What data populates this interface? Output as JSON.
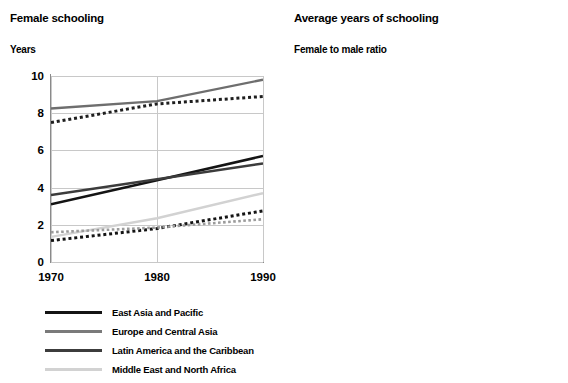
{
  "chart_data": [
    {
      "id": "female-schooling",
      "type": "line",
      "title": "Female schooling",
      "subtitle": "Years",
      "ylabel": "Years",
      "xlabel": "",
      "x": [
        1970,
        1980,
        1990
      ],
      "xticks": [
        "1970",
        "1980",
        "1990"
      ],
      "yticks": [
        "0",
        "2",
        "4",
        "6",
        "8",
        "10"
      ],
      "ylim": [
        0,
        10
      ],
      "xlim": [
        1970,
        1990
      ],
      "grid": true,
      "legend_position": "below",
      "series": [
        {
          "name": "East Asia and Pacific",
          "style": "solid",
          "color": "#141414",
          "width": 2.6,
          "values": [
            3.1,
            4.4,
            5.7
          ]
        },
        {
          "name": "Europe and Central Asia",
          "style": "solid",
          "color": "#6e6e6e",
          "width": 2.4,
          "values": [
            8.25,
            8.65,
            9.8
          ]
        },
        {
          "name": "Latin America and the Caribbean",
          "style": "solid",
          "color": "#3c3c3c",
          "width": 2.4,
          "values": [
            3.6,
            4.45,
            5.3
          ]
        },
        {
          "name": "Middle East and North Africa",
          "style": "solid",
          "color": "#d2d2d2",
          "width": 2.4,
          "values": [
            1.35,
            2.35,
            3.7
          ]
        },
        {
          "name": "South Asia",
          "style": "dotted",
          "color": "#141414",
          "width": 3.0,
          "values": [
            1.15,
            1.8,
            2.75
          ]
        },
        {
          "name": "Sub-Saharan Africa",
          "style": "dotted",
          "color": "#9b9b9b",
          "width": 2.6,
          "values": [
            1.6,
            1.85,
            2.3
          ]
        },
        {
          "name": "OECD",
          "style": "dotted",
          "color": "#1e1e1e",
          "width": 3.0,
          "values": [
            7.5,
            8.5,
            8.9
          ]
        }
      ]
    },
    {
      "id": "female-to-male-ratio",
      "type": "line",
      "title": "Average years of schooling",
      "subtitle": "Female to male ratio",
      "ylabel": "Female to male ratio",
      "xlabel": "",
      "x": [
        1970,
        1980,
        1990
      ],
      "xticks": [
        "1970",
        "1980",
        "1990"
      ],
      "yticks": [
        "0.2",
        "0.4",
        "0.6",
        "0.8",
        "1.0"
      ],
      "ylim": [
        0.2,
        1.0
      ],
      "xlim": [
        1970,
        1990
      ],
      "grid": true,
      "legend_position": "below",
      "series": [
        {
          "name": "East Asia and Pacific",
          "style": "solid",
          "color": "#141414",
          "width": 2.6,
          "values": [
            0.67,
            0.765,
            0.855
          ]
        },
        {
          "name": "Europe and Central Asia",
          "style": "solid",
          "color": "#6e6e6e",
          "width": 2.4,
          "values": [
            0.92,
            0.93,
            0.955
          ]
        },
        {
          "name": "Latin America and the Caribbean",
          "style": "solid",
          "color": "#3c3c3c",
          "width": 2.4,
          "values": [
            0.855,
            0.95,
            0.975
          ]
        },
        {
          "name": "Middle East and North Africa",
          "style": "solid",
          "color": "#d2d2d2",
          "width": 2.4,
          "values": [
            0.51,
            0.59,
            0.67
          ]
        },
        {
          "name": "South Asia",
          "style": "dotted",
          "color": "#141414",
          "width": 3.0,
          "values": [
            0.375,
            0.43,
            0.525
          ]
        },
        {
          "name": "Sub-Saharan Africa",
          "style": "dotted",
          "color": "#9b9b9b",
          "width": 2.6,
          "values": [
            0.595,
            0.612,
            0.62
          ]
        },
        {
          "name": "OECD",
          "style": "dotted",
          "color": "#1e1e1e",
          "width": 3.0,
          "values": [
            0.955,
            0.96,
            0.962
          ]
        }
      ]
    }
  ],
  "left_panel": {
    "title": "Female schooling",
    "subtitle": "Years",
    "yticks": [
      "10",
      "8",
      "6",
      "4",
      "2",
      "0"
    ],
    "xticks": [
      "1970",
      "1980",
      "1990"
    ]
  },
  "right_panel": {
    "title": "Average years of schooling",
    "subtitle": "Female to male ratio",
    "yticks": [
      "1.0",
      "0.8",
      "0.6",
      "0.4",
      "0.2"
    ],
    "xticks": [
      "1970",
      "1980",
      "1990"
    ]
  },
  "legend_left": {
    "items": [
      {
        "label": "East Asia and Pacific",
        "style": "solid",
        "color": "#141414",
        "width": 3.2
      },
      {
        "label": "Europe and Central Asia",
        "style": "solid",
        "color": "#7a7a7a",
        "width": 2.8
      },
      {
        "label": "Latin America and the Caribbean",
        "style": "solid",
        "color": "#3c3c3c",
        "width": 3.0
      },
      {
        "label": "Middle East and North Africa",
        "style": "solid",
        "color": "#d2d2d2",
        "width": 2.8
      }
    ]
  },
  "legend_right": {
    "items": [
      {
        "label": "South Asia",
        "style": "dotted",
        "color": "#141414",
        "width": 3.2
      },
      {
        "label": "Sub-Saharan Africa",
        "style": "dotted",
        "color": "#9b9b9b",
        "width": 2.8
      },
      {
        "label": "OECD",
        "style": "dotted",
        "color": "#1e1e1e",
        "width": 3.2
      }
    ]
  },
  "colors": {
    "grid": "#c8c8c8",
    "axis": "#8a8a8a",
    "text": "#000000",
    "background": "#ffffff"
  }
}
